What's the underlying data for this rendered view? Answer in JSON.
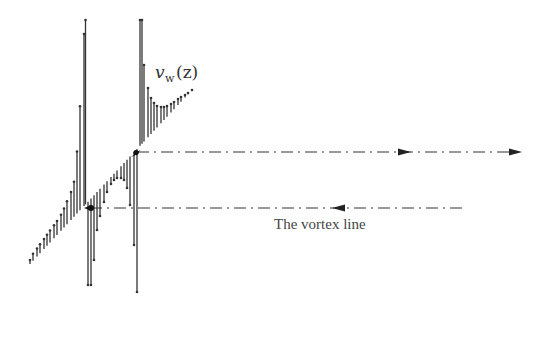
{
  "diagram": {
    "title": "",
    "labels": {
      "velocity_var": "v",
      "velocity_sub": "w",
      "velocity_arg": "(z)",
      "vortex_line": "The vortex line"
    },
    "colors": {
      "stroke": "#333333",
      "background": "#ffffff"
    },
    "vortex_lines": [
      {
        "name": "upper",
        "y": 152,
        "x_start": 137,
        "x_end": 520,
        "direction": "right",
        "arrows_x": [
          405,
          515
        ]
      },
      {
        "name": "lower",
        "y": 208,
        "x_start": 90,
        "x_end": 465,
        "direction": "left",
        "arrows_x": [
          337
        ]
      }
    ],
    "baseline": {
      "x1": 30,
      "y1": 264,
      "x2": 192,
      "y2": 90
    },
    "singular_points": [
      {
        "name": "lower-vortex",
        "x": 90,
        "y": 208
      },
      {
        "name": "upper-vortex",
        "x": 137,
        "y": 152
      }
    ]
  }
}
